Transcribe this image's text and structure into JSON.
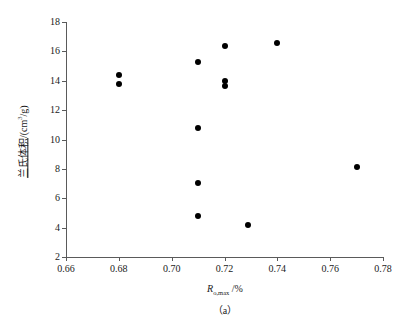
{
  "chart_data": {
    "type": "scatter",
    "title": "",
    "caption": "（a）",
    "xlabel": "R o,max /%",
    "xlabel_parts": {
      "symbol": "R",
      "subscript": "o,max",
      "separator": " /",
      "unit": "%"
    },
    "ylabel": "兰氏体积/(cm³/g)",
    "ylabel_parts": {
      "cjk": "兰氏体积",
      "separator": "/(",
      "unit_base": "cm",
      "unit_sup": "3",
      "unit_tail": "/g)"
    },
    "xlim": [
      0.66,
      0.78
    ],
    "ylim": [
      2,
      18
    ],
    "xticks": [
      0.66,
      0.68,
      0.7,
      0.72,
      0.74,
      0.76,
      0.78
    ],
    "xticklabels": [
      "0.66",
      "0.68",
      "0.70",
      "0.72",
      "0.74",
      "0.76",
      "0.78"
    ],
    "yticks": [
      2,
      4,
      6,
      8,
      10,
      12,
      14,
      16,
      18
    ],
    "yticklabels": [
      "2",
      "4",
      "6",
      "8",
      "10",
      "12",
      "14",
      "16",
      "18"
    ],
    "grid": false,
    "legend": null,
    "marker": {
      "shape": "circle",
      "color": "#000000",
      "size_px": 6
    },
    "axis_color": "#5a5a5a",
    "background": "#ffffff",
    "points": [
      {
        "x": 0.68,
        "y": 14.4
      },
      {
        "x": 0.68,
        "y": 13.8
      },
      {
        "x": 0.71,
        "y": 15.25
      },
      {
        "x": 0.71,
        "y": 10.8
      },
      {
        "x": 0.71,
        "y": 7.05
      },
      {
        "x": 0.71,
        "y": 4.8
      },
      {
        "x": 0.72,
        "y": 16.4
      },
      {
        "x": 0.72,
        "y": 13.95
      },
      {
        "x": 0.72,
        "y": 13.65
      },
      {
        "x": 0.729,
        "y": 4.15
      },
      {
        "x": 0.74,
        "y": 16.6
      },
      {
        "x": 0.77,
        "y": 8.1
      }
    ]
  }
}
